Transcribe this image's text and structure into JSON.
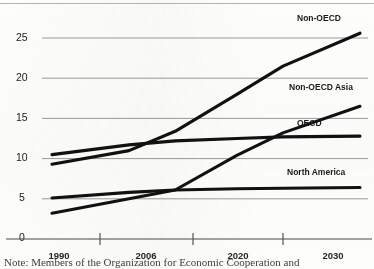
{
  "chart_data": {
    "type": "line",
    "title": "",
    "subtitle": "",
    "xlabel": "",
    "ylabel": "",
    "grid": true,
    "legend_position": "inline-right",
    "x": [
      1990,
      2006,
      2020,
      2030
    ],
    "xlim": [
      1990,
      2030
    ],
    "ylim": [
      0,
      27
    ],
    "x_tick_labels": [
      "1990",
      "2006",
      "2020",
      "2030"
    ],
    "y_tick_labels": [
      "0",
      "5",
      "10",
      "15",
      "20",
      "25"
    ],
    "y_ticks": [
      0,
      5,
      10,
      15,
      20,
      25
    ],
    "series": [
      {
        "name": "Non-OECD",
        "label": "Non-OECD",
        "color": "#111111",
        "values": [
          9.3,
          13.4,
          21.5,
          25.6
        ],
        "x": [
          1990,
          2006,
          2020,
          2030
        ],
        "points": [
          {
            "x": 1990,
            "y": 9.3
          },
          {
            "x": 2000,
            "y": 11.0
          },
          {
            "x": 2006,
            "y": 13.4
          },
          {
            "x": 2014,
            "y": 18.0
          },
          {
            "x": 2020,
            "y": 21.5
          },
          {
            "x": 2030,
            "y": 25.6
          }
        ]
      },
      {
        "name": "Non-OECD Asia",
        "label": "Non-OECD Asia",
        "color": "#111111",
        "values": [
          3.2,
          6.1,
          13.2,
          16.5
        ],
        "x": [
          1990,
          2006,
          2020,
          2030
        ],
        "points": [
          {
            "x": 1990,
            "y": 3.2
          },
          {
            "x": 2000,
            "y": 5.0
          },
          {
            "x": 2006,
            "y": 6.1
          },
          {
            "x": 2014,
            "y": 10.4
          },
          {
            "x": 2020,
            "y": 13.2
          },
          {
            "x": 2030,
            "y": 16.5
          }
        ]
      },
      {
        "name": "OECD",
        "label": "OECD",
        "color": "#111111",
        "values": [
          10.5,
          12.2,
          12.7,
          12.8
        ],
        "x": [
          1990,
          2006,
          2020,
          2030
        ],
        "points": [
          {
            "x": 1990,
            "y": 10.5
          },
          {
            "x": 2000,
            "y": 11.7
          },
          {
            "x": 2006,
            "y": 12.2
          },
          {
            "x": 2014,
            "y": 12.5
          },
          {
            "x": 2020,
            "y": 12.7
          },
          {
            "x": 2030,
            "y": 12.8
          }
        ]
      },
      {
        "name": "North America",
        "label": "North America",
        "color": "#111111",
        "values": [
          5.1,
          6.1,
          6.3,
          6.4
        ],
        "x": [
          1990,
          2006,
          2020,
          2030
        ],
        "points": [
          {
            "x": 1990,
            "y": 5.1
          },
          {
            "x": 2000,
            "y": 5.8
          },
          {
            "x": 2006,
            "y": 6.1
          },
          {
            "x": 2014,
            "y": 6.25
          },
          {
            "x": 2020,
            "y": 6.3
          },
          {
            "x": 2030,
            "y": 6.4
          }
        ]
      }
    ]
  },
  "axis": {
    "y_labels": [
      "25",
      "20",
      "15",
      "10",
      "5",
      "0"
    ],
    "x_labels": [
      "1990",
      "2006",
      "2020",
      "2030"
    ]
  },
  "series_labels": {
    "non_oecd": "Non-OECD",
    "non_oecd_asia": "Non-OECD Asia",
    "oecd": "OECD",
    "north_america": "North America"
  },
  "footnote": {
    "text": "Note: Members of the Organization for Economic Cooperation and"
  },
  "colors": {
    "line": "#111111",
    "gridline": "#9a9a9a",
    "axis": "#3a3a3a",
    "text": "#1a1a1a",
    "background": "#fdfdfc"
  }
}
